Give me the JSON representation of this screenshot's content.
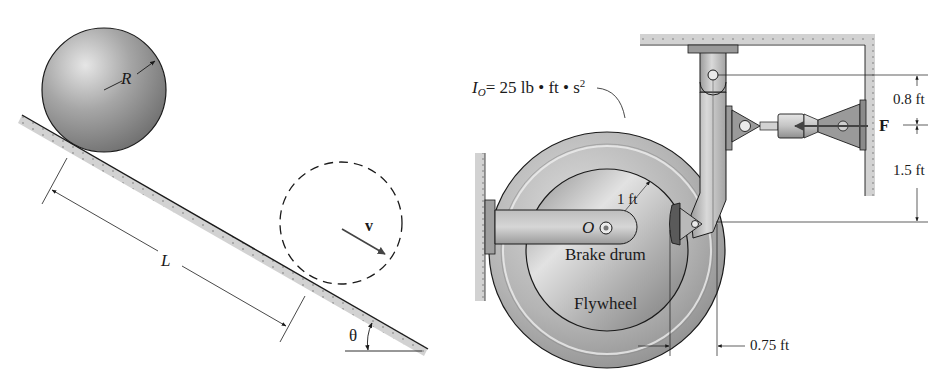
{
  "figure_left": {
    "title": "Sphere rolling down incline",
    "labels": {
      "radius": "R",
      "length": "L",
      "velocity": "v",
      "angle": "θ"
    }
  },
  "figure_right": {
    "title": "Flywheel with brake drum and lever",
    "labels": {
      "inertia_symbol": "I",
      "inertia_sub": "O",
      "inertia_value": "= 25 lb • ft • s",
      "inertia_exp": "2",
      "drum_radius": "1 ft",
      "center": "O",
      "brake_drum": "Brake drum",
      "flywheel": "Flywheel",
      "force": "F",
      "dim_top": "0.8 ft",
      "dim_bottom": "1.5 ft",
      "dim_horizontal": "0.75 ft"
    }
  },
  "colors": {
    "ink": "#1a1a1a",
    "metal_light": "#d8d8d8",
    "metal_mid": "#a9a9a9",
    "metal_dark": "#6f6f6f",
    "ground_fill": "#cfcfcf"
  }
}
